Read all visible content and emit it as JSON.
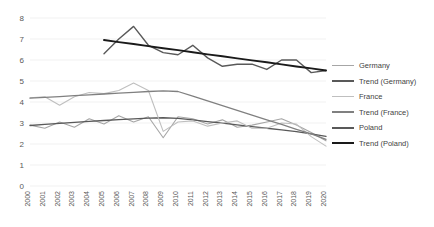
{
  "chart_data": {
    "type": "line",
    "title": "",
    "xlabel": "",
    "ylabel": "",
    "x": [
      2000,
      2001,
      2002,
      2003,
      2004,
      2005,
      2006,
      2007,
      2008,
      2009,
      2010,
      2011,
      2012,
      2013,
      2014,
      2015,
      2016,
      2017,
      2018,
      2019,
      2020
    ],
    "xlim": [
      2000,
      2020
    ],
    "ylim": [
      0,
      8
    ],
    "yticks": [
      0,
      1,
      2,
      3,
      4,
      5,
      6,
      7,
      8
    ],
    "grid": true,
    "legend_position": "right",
    "series": [
      {
        "name": "Germany",
        "color": "#a6a6a6",
        "width": 1.1,
        "values": [
          2.9,
          2.75,
          3.05,
          2.8,
          3.2,
          2.95,
          3.35,
          3.05,
          3.3,
          2.3,
          3.3,
          3.2,
          2.95,
          3.15,
          2.8,
          2.9,
          3.05,
          3.2,
          2.9,
          2.55,
          2.15
        ]
      },
      {
        "name": "Trend (Germany)",
        "color": "#595959",
        "width": 1.3,
        "values": [
          2.88,
          2.93,
          2.98,
          3.03,
          3.08,
          3.12,
          3.16,
          3.2,
          3.23,
          3.25,
          3.22,
          3.15,
          3.07,
          2.99,
          2.91,
          2.83,
          2.75,
          2.67,
          2.59,
          2.48,
          2.36
        ]
      },
      {
        "name": "France",
        "color": "#bfbfbf",
        "width": 1.1,
        "values": [
          4.2,
          4.25,
          3.85,
          4.25,
          4.45,
          4.4,
          4.55,
          4.9,
          4.55,
          2.6,
          3.05,
          3.1,
          2.85,
          3.0,
          3.1,
          2.75,
          2.75,
          3.0,
          2.95,
          2.35,
          1.9
        ]
      },
      {
        "name": "Trend (France)",
        "color": "#808080",
        "width": 1.3,
        "values": [
          4.18,
          4.22,
          4.26,
          4.3,
          4.34,
          4.38,
          4.42,
          4.46,
          4.5,
          4.53,
          4.5,
          4.28,
          4.05,
          3.83,
          3.6,
          3.38,
          3.15,
          2.93,
          2.7,
          2.48,
          2.22
        ]
      },
      {
        "name": "Poland",
        "color": "#595959",
        "width": 1.4,
        "start_index": 5,
        "values": [
          null,
          null,
          null,
          null,
          null,
          6.3,
          7.0,
          7.6,
          6.7,
          6.35,
          6.25,
          6.7,
          6.1,
          5.7,
          5.8,
          5.8,
          5.55,
          6.0,
          6.0,
          5.4,
          5.5
        ]
      },
      {
        "name": "Trend (Poland)",
        "color": "#1a1a1a",
        "width": 1.9,
        "start_index": 5,
        "values": [
          null,
          null,
          null,
          null,
          null,
          6.95,
          6.85,
          6.76,
          6.66,
          6.56,
          6.47,
          6.37,
          6.27,
          6.18,
          6.08,
          5.98,
          5.89,
          5.79,
          5.69,
          5.6,
          5.5
        ]
      }
    ],
    "legend": [
      {
        "label": "Germany",
        "color": "#a6a6a6",
        "width": 1.2
      },
      {
        "label": "Trend (Germany)",
        "color": "#595959",
        "width": 2.2
      },
      {
        "label": "France",
        "color": "#bfbfbf",
        "width": 1.2
      },
      {
        "label": "Trend (France)",
        "color": "#808080",
        "width": 2.0
      },
      {
        "label": "Poland",
        "color": "#595959",
        "width": 2.2
      },
      {
        "label": "Trend (Poland)",
        "color": "#1a1a1a",
        "width": 2.6
      }
    ]
  }
}
